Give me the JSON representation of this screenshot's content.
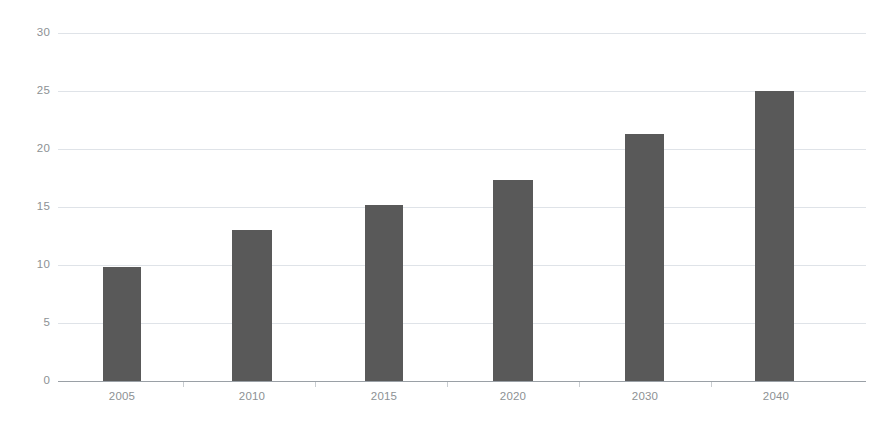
{
  "chart_data": {
    "type": "bar",
    "title": "",
    "subtitle": "",
    "xlabel": "",
    "ylabel": "",
    "categories": [
      "2005",
      "2010",
      "2015",
      "2020",
      "2030",
      "2040"
    ],
    "values": [
      9.8,
      13.0,
      15.2,
      17.3,
      21.3,
      25.0
    ],
    "series": [
      {
        "name": "",
        "values": [
          9.8,
          13.0,
          15.2,
          17.3,
          21.3,
          25.0
        ]
      }
    ],
    "ylim": [
      0,
      30
    ],
    "yticks": [
      0,
      5,
      10,
      15,
      20,
      25,
      30
    ],
    "ytick_labels": [
      "0",
      "5",
      "10",
      "15",
      "20",
      "25",
      "30"
    ],
    "xtick_labels": [
      "2005",
      "2010",
      "2015",
      "2020",
      "2030",
      "2040"
    ],
    "grid": true,
    "grid_axis": "y",
    "legend": false,
    "legend_position": "none",
    "annotations": [],
    "colors": {
      "bar": "#595959",
      "gridline": "#dfe3e8",
      "axis": "#9aa0a6",
      "tick_text": "#8d9194",
      "background": "#ffffff"
    }
  }
}
